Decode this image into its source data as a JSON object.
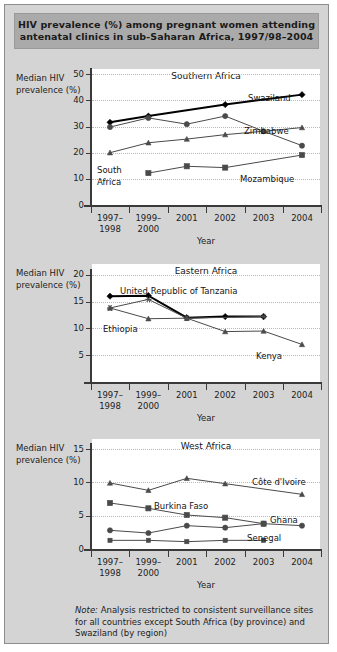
{
  "title": {
    "line1": "HIV prevalence (%) among pregnant women attending",
    "line2": "antenatal clinics in sub-Saharan Africa, 1997/98–2004"
  },
  "axis_caption": "Median HIV prevalence (%)",
  "xaxis_title": "Year",
  "note": {
    "label": "Note:",
    "text": " Analysis restricted to consistent surveillance sites for all countries except South Africa (by province) and Swaziland (by region)"
  },
  "chart_data": [
    {
      "type": "line",
      "title": "Southern Africa",
      "xlabel": "Year",
      "ylabel": "Median HIV prevalence (%)",
      "categories": [
        "1997–1998",
        "1999–2000",
        "2001",
        "2002",
        "2003",
        "2004"
      ],
      "category_lines": [
        [
          "1997–",
          "1998"
        ],
        [
          "1999–",
          "2000"
        ],
        [
          "2001",
          ""
        ],
        [
          "2002",
          ""
        ],
        [
          "2003",
          ""
        ],
        [
          "2004",
          ""
        ]
      ],
      "ylim": [
        0,
        52
      ],
      "yticks": [
        0,
        10,
        20,
        30,
        40,
        50
      ],
      "grid": true,
      "legend_position": "inline",
      "series": [
        {
          "name": "Swaziland",
          "marker": "diamond",
          "emphasis": true,
          "values": [
            31.6,
            34.0,
            null,
            38.4,
            null,
            42.2
          ]
        },
        {
          "name": "Zimbabwe",
          "marker": "circle",
          "emphasis": false,
          "values": [
            29.8,
            33.3,
            30.9,
            34.0,
            28.2,
            22.7
          ]
        },
        {
          "name": "South Africa",
          "marker": "triangle",
          "emphasis": false,
          "values": [
            20.0,
            23.8,
            25.2,
            26.9,
            28.2,
            29.6
          ]
        },
        {
          "name": "Mozambique",
          "marker": "square",
          "emphasis": false,
          "values": [
            null,
            12.2,
            14.8,
            14.3,
            null,
            19.1
          ]
        }
      ]
    },
    {
      "type": "line",
      "title": "Eastern Africa",
      "xlabel": "Year",
      "ylabel": "Median HIV prevalence (%)",
      "categories": [
        "1997–1998",
        "1999–2000",
        "2001",
        "2002",
        "2003",
        "2004"
      ],
      "category_lines": [
        [
          "1997–",
          "1998"
        ],
        [
          "1999–",
          "2000"
        ],
        [
          "2001",
          ""
        ],
        [
          "2002",
          ""
        ],
        [
          "2003",
          ""
        ],
        [
          "2004",
          ""
        ]
      ],
      "ylim": [
        0,
        22
      ],
      "yticks": [
        5,
        10,
        15,
        20
      ],
      "grid": true,
      "legend_position": "inline",
      "series": [
        {
          "name": "United Republic of Tanzania",
          "marker": "diamond",
          "emphasis": true,
          "values": [
            16.0,
            16.1,
            12.0,
            12.2,
            12.2,
            null
          ]
        },
        {
          "name": "Ethiopia",
          "marker": "asterisk",
          "emphasis": false,
          "values": [
            13.8,
            15.4,
            11.9,
            null,
            12.2,
            null
          ]
        },
        {
          "name": "Kenya",
          "marker": "triangle",
          "emphasis": false,
          "values": [
            13.8,
            11.8,
            11.9,
            9.4,
            9.5,
            7.0
          ]
        }
      ]
    },
    {
      "type": "line",
      "title": "West Africa",
      "xlabel": "Year",
      "ylabel": "Median HIV prevalence (%)",
      "categories": [
        "1997–1998",
        "1999–2000",
        "2001",
        "2002",
        "2003",
        "2004"
      ],
      "category_lines": [
        [
          "1997–",
          "1998"
        ],
        [
          "1999–",
          "2000"
        ],
        [
          "2001",
          ""
        ],
        [
          "2002",
          ""
        ],
        [
          "2003",
          ""
        ],
        [
          "2004",
          ""
        ]
      ],
      "ylim": [
        0,
        16.5
      ],
      "yticks": [
        0,
        5,
        10,
        15
      ],
      "grid": true,
      "legend_position": "inline",
      "series": [
        {
          "name": "Côte d'Ivoire",
          "marker": "triangle",
          "emphasis": false,
          "values": [
            9.9,
            8.8,
            10.6,
            9.8,
            null,
            8.2
          ]
        },
        {
          "name": "Burkina Faso",
          "marker": "square",
          "emphasis": false,
          "values": [
            6.9,
            6.1,
            5.1,
            4.7,
            3.8,
            null
          ]
        },
        {
          "name": "Ghana",
          "marker": "circle",
          "emphasis": false,
          "values": [
            2.8,
            2.4,
            3.5,
            3.2,
            3.8,
            3.5
          ]
        },
        {
          "name": "Senegal",
          "marker": "smallsquare",
          "emphasis": false,
          "values": [
            1.3,
            1.3,
            1.1,
            1.3,
            1.3,
            null
          ]
        }
      ]
    }
  ],
  "panel_layout": [
    {
      "top": 58,
      "plot_left": 87,
      "plot_top": 6,
      "plot_w": 228,
      "plot_h": 136,
      "caption_top": 10,
      "labels": [
        {
          "text": "Swaziland",
          "x": 156,
          "y": 24
        },
        {
          "text": "Zimbabwe",
          "x": 152,
          "y": 57
        },
        {
          "text": "South",
          "x": 5,
          "y": 96
        },
        {
          "text": "Africa",
          "x": 5,
          "y": 108
        },
        {
          "text": "Mozambique",
          "x": 148,
          "y": 105
        }
      ]
    },
    {
      "top": 253,
      "plot_left": 87,
      "plot_top": 6,
      "plot_w": 228,
      "plot_h": 118,
      "caption_top": 10,
      "labels": [
        {
          "text": "United Republic of Tanzania",
          "x": 28,
          "y": 22
        },
        {
          "text": "Ethiopia",
          "x": 11,
          "y": 60
        },
        {
          "text": "Kenya",
          "x": 164,
          "y": 87
        }
      ]
    },
    {
      "top": 428,
      "plot_left": 87,
      "plot_top": 6,
      "plot_w": 228,
      "plot_h": 110,
      "caption_top": 10,
      "labels": [
        {
          "text": "Côte d'Ivoire",
          "x": 160,
          "y": 38
        },
        {
          "text": "Burkina Faso",
          "x": 62,
          "y": 62
        },
        {
          "text": "Ghana",
          "x": 178,
          "y": 76
        },
        {
          "text": "Senegal",
          "x": 155,
          "y": 94
        }
      ]
    }
  ],
  "colors": {
    "page_background": "#d4d4d4",
    "banner_background": "#aaaaaa",
    "plot_background": "#ffffff",
    "axis": "#3a3a3a",
    "grid": "#b9b9b9",
    "line_default": "#4a4a4a",
    "line_emphasis": "#000000",
    "text": "#1c1c1c"
  }
}
